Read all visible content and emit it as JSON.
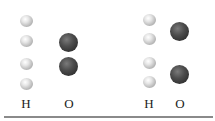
{
  "figure": {
    "panels": [
      {
        "name": "left",
        "columns": [
          {
            "element": "H",
            "label": "H",
            "count": 4
          },
          {
            "element": "O",
            "label": "O",
            "count": 2
          }
        ]
      },
      {
        "name": "right",
        "columns": [
          {
            "element": "H",
            "label": "H",
            "count": 4
          },
          {
            "element": "O",
            "label": "O",
            "count": 2
          }
        ]
      }
    ],
    "colors": {
      "hydrogen": "#d9d9d9",
      "oxygen": "#3a3a3a",
      "baseline": "#8a8a8a"
    }
  }
}
